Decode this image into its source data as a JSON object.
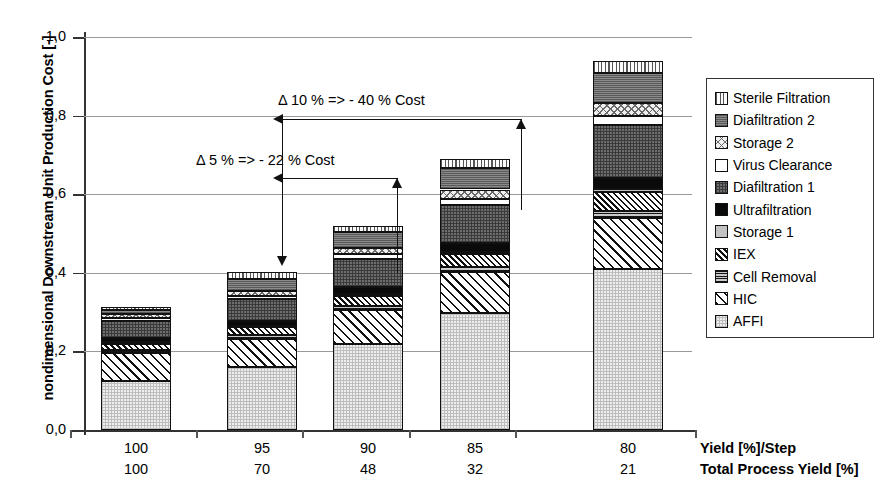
{
  "chart_data": {
    "type": "bar",
    "title": "",
    "ylabel": "nondimensional Downstream Unit Production Cost [-]",
    "xlabel": "",
    "ylim": [
      0.0,
      1.0
    ],
    "ytick_labels": [
      "1,0",
      "0,8",
      "0,6",
      "0,4",
      "0,2",
      "0,0"
    ],
    "ytick_values": [
      1.0,
      0.8,
      0.6,
      0.4,
      0.2,
      0.0
    ],
    "grid": true,
    "stacked": true,
    "legend_position": "right",
    "categories": [
      "100",
      "95",
      "90",
      "85",
      "80"
    ],
    "secondary_categories": [
      "100",
      "70",
      "48",
      "32",
      "21"
    ],
    "category_axis_label": "Yield [%]/Step",
    "secondary_axis_label": "Total Process Yield [%]",
    "totals": [
      0.313,
      0.401,
      0.52,
      0.69,
      0.94
    ],
    "series": [
      {
        "name": "AFFI",
        "pattern": "p-affi",
        "values": [
          0.125,
          0.16,
          0.22,
          0.298,
          0.41
        ]
      },
      {
        "name": "HIC",
        "pattern": "p-hic",
        "values": [
          0.07,
          0.072,
          0.085,
          0.103,
          0.13
        ]
      },
      {
        "name": "Cell Removal",
        "pattern": "p-cellrem",
        "values": [
          0.008,
          0.009,
          0.011,
          0.013,
          0.018
        ]
      },
      {
        "name": "IEX",
        "pattern": "p-iex",
        "values": [
          0.016,
          0.02,
          0.026,
          0.034,
          0.047
        ]
      },
      {
        "name": "Storage 1",
        "pattern": "p-storage1",
        "values": [
          0.004,
          0.004,
          0.005,
          0.006,
          0.008
        ]
      },
      {
        "name": "Ultrafiltration",
        "pattern": "p-ultra",
        "values": [
          0.011,
          0.013,
          0.016,
          0.021,
          0.029
        ]
      },
      {
        "name": "Diafiltration 1",
        "pattern": "p-diaf1",
        "values": [
          0.043,
          0.055,
          0.072,
          0.098,
          0.135
        ]
      },
      {
        "name": "Virus Clearance",
        "pattern": "p-virus",
        "values": [
          0.007,
          0.009,
          0.012,
          0.016,
          0.022
        ]
      },
      {
        "name": "Storage 2",
        "pattern": "p-storage2",
        "values": [
          0.01,
          0.013,
          0.017,
          0.023,
          0.032
        ]
      },
      {
        "name": "Diafiltration 2",
        "pattern": "p-diaf2",
        "values": [
          0.012,
          0.03,
          0.04,
          0.055,
          0.077
        ]
      },
      {
        "name": "Sterile Filtration",
        "pattern": "p-sterile",
        "values": [
          0.007,
          0.016,
          0.016,
          0.023,
          0.032
        ]
      }
    ],
    "annotations": [
      {
        "text": "Δ 10 % => - 40 % Cost",
        "from_category": "95",
        "to_category": "85"
      },
      {
        "text": "Δ 5 % => - 22 % Cost",
        "from_category": "95",
        "to_category": "90"
      }
    ]
  },
  "legend": {
    "items": [
      {
        "label": "Sterile Filtration",
        "pattern": "p-sterile"
      },
      {
        "label": "Diafiltration 2",
        "pattern": "p-diaf2"
      },
      {
        "label": "Storage 2",
        "pattern": "p-storage2"
      },
      {
        "label": "Virus Clearance",
        "pattern": "p-virus"
      },
      {
        "label": "Diafiltration 1",
        "pattern": "p-diaf1"
      },
      {
        "label": "Ultrafiltration",
        "pattern": "p-ultra"
      },
      {
        "label": "Storage 1",
        "pattern": "p-storage1"
      },
      {
        "label": "IEX",
        "pattern": "p-iex"
      },
      {
        "label": "Cell Removal",
        "pattern": "p-cellrem"
      },
      {
        "label": "HIC",
        "pattern": "p-hic"
      },
      {
        "label": "AFFI",
        "pattern": "p-affi"
      }
    ]
  },
  "colors": {
    "axis": "#333333",
    "grid": "#999999",
    "background": "#ffffff",
    "ink": "#000000"
  }
}
